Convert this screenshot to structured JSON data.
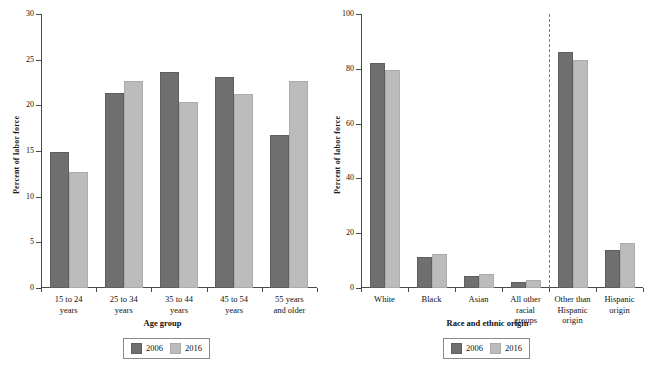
{
  "chart_data": [
    {
      "id": "age-group-chart",
      "type": "bar",
      "title": "",
      "xlabel": "Age group",
      "ylabel": "Percent of labor force",
      "ylim": [
        0,
        30
      ],
      "yticks": [
        0,
        5,
        10,
        15,
        20,
        25,
        30
      ],
      "grid": false,
      "legend_position": "bottom",
      "categories": [
        "15 to 24\nyears",
        "25 to 34\nyears",
        "35 to 44\nyears",
        "45 to 54\nyears",
        "55 years\nand older"
      ],
      "series": [
        {
          "name": "2006",
          "color": "#6f6f6f",
          "values": [
            14.9,
            21.4,
            23.6,
            23.1,
            16.8
          ]
        },
        {
          "name": "2016",
          "color": "#bcbcbc",
          "values": [
            12.7,
            22.7,
            20.4,
            21.2,
            22.7
          ]
        }
      ]
    },
    {
      "id": "race-ethnic-origin-chart",
      "type": "bar",
      "title": "",
      "xlabel": "Race and ethnic origin",
      "ylabel": "Percent of labor force",
      "ylim": [
        0,
        100
      ],
      "yticks": [
        0,
        20,
        40,
        60,
        80,
        100
      ],
      "grid": false,
      "legend_position": "bottom",
      "divider_after_category_index": 3,
      "categories": [
        "White",
        "Black",
        "Asian",
        "All other\nracial\ngroups",
        "Other than\nHispanic\norigin",
        "Hispanic\norigin"
      ],
      "series": [
        {
          "name": "2006",
          "color": "#6f6f6f",
          "values": [
            82.0,
            11.5,
            4.3,
            2.2,
            86.1,
            13.8
          ]
        },
        {
          "name": "2016",
          "color": "#bcbcbc",
          "values": [
            79.5,
            12.5,
            5.0,
            2.8,
            83.3,
            16.4
          ]
        }
      ]
    }
  ],
  "legend": {
    "items": [
      {
        "label": "2006",
        "swatch": "series-2006-swatch"
      },
      {
        "label": "2016",
        "swatch": "series-2016-swatch"
      }
    ]
  }
}
